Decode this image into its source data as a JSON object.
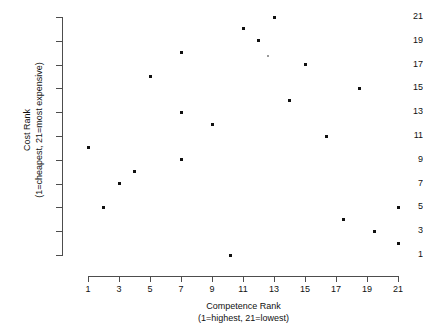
{
  "chart_data": {
    "type": "scatter",
    "title": "",
    "xlabel": "Competence Rank",
    "xlabel_sub": "(1=highest, 21=lowest)",
    "ylabel": "Cost Rank",
    "ylabel_sub": "(1=cheapest, 21=most expensive)",
    "xlim": [
      1,
      21
    ],
    "ylim": [
      1,
      21
    ],
    "xticks": [
      1,
      3,
      5,
      7,
      9,
      11,
      13,
      15,
      17,
      19,
      21
    ],
    "yticks": [
      1,
      3,
      5,
      7,
      9,
      11,
      13,
      15,
      17,
      19,
      21
    ],
    "grid": false,
    "legend": null,
    "marker_color": "#111111",
    "axis_color": "#4d4d4d",
    "points": [
      {
        "x": 1,
        "y": 10,
        "faint": false
      },
      {
        "x": 2,
        "y": 5,
        "faint": false
      },
      {
        "x": 3,
        "y": 7,
        "faint": false
      },
      {
        "x": 4,
        "y": 8,
        "faint": false
      },
      {
        "x": 5,
        "y": 16,
        "faint": false
      },
      {
        "x": 7,
        "y": 18,
        "faint": false
      },
      {
        "x": 7,
        "y": 13,
        "faint": false
      },
      {
        "x": 7,
        "y": 9,
        "faint": false
      },
      {
        "x": 9,
        "y": 12,
        "faint": false
      },
      {
        "x": 10.2,
        "y": 1,
        "faint": false
      },
      {
        "x": 11,
        "y": 20,
        "faint": false
      },
      {
        "x": 12,
        "y": 19,
        "faint": false
      },
      {
        "x": 12.6,
        "y": 17.7,
        "faint": true
      },
      {
        "x": 13,
        "y": 21,
        "faint": false
      },
      {
        "x": 14,
        "y": 14,
        "faint": false
      },
      {
        "x": 15,
        "y": 17,
        "faint": false
      },
      {
        "x": 16.4,
        "y": 11,
        "faint": false
      },
      {
        "x": 17.5,
        "y": 4,
        "faint": false
      },
      {
        "x": 18.5,
        "y": 15,
        "faint": false
      },
      {
        "x": 19.5,
        "y": 3,
        "faint": false
      },
      {
        "x": 21,
        "y": 5,
        "faint": false
      },
      {
        "x": 21,
        "y": 2,
        "faint": false
      }
    ]
  }
}
